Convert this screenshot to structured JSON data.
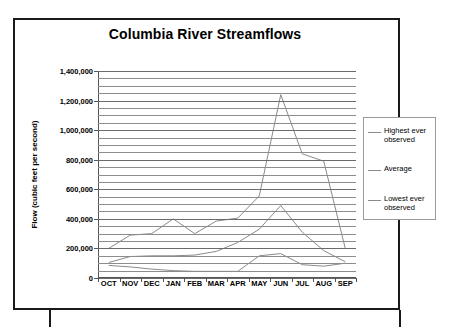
{
  "chart_data": {
    "type": "line",
    "title": "Columbia River Streamflows",
    "xlabel": "",
    "ylabel": "Flow (cubic feet per second)",
    "categories": [
      "OCT",
      "NOV",
      "DEC",
      "JAN",
      "FEB",
      "MAR",
      "APR",
      "MAY",
      "JUN",
      "JUL",
      "AUG",
      "SEP"
    ],
    "ylim": [
      0,
      1400000
    ],
    "ytick_labels": [
      "0",
      "200,000",
      "400,000",
      "600,000",
      "800,000",
      "1,000,000",
      "1,200,000",
      "1,400,000"
    ],
    "ytick_values": [
      0,
      200000,
      400000,
      600000,
      800000,
      1000000,
      1200000,
      1400000
    ],
    "ytick_step": 200000,
    "gridline_step": 50000,
    "grid": "horizontal",
    "legend_position": "right",
    "series": [
      {
        "name": "Highest ever observed",
        "color": "#8a8a8a",
        "values": [
          200000,
          290000,
          300000,
          400000,
          300000,
          385000,
          405000,
          555000,
          1240000,
          840000,
          790000,
          200000
        ]
      },
      {
        "name": "Average",
        "color": "#8a8a8a",
        "values": [
          105000,
          145000,
          150000,
          150000,
          155000,
          180000,
          240000,
          330000,
          490000,
          310000,
          185000,
          110000
        ]
      },
      {
        "name": "Lowest ever observed",
        "color": "#8a8a8a",
        "values": [
          85000,
          75000,
          60000,
          50000,
          45000,
          45000,
          45000,
          150000,
          165000,
          90000,
          80000,
          100000
        ]
      }
    ]
  },
  "legend": {
    "entries": [
      {
        "label": "Highest ever observed"
      },
      {
        "label": "Average"
      },
      {
        "label": "Lowest ever observed"
      }
    ]
  }
}
